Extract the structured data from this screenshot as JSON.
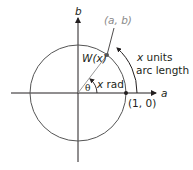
{
  "diagram": {
    "axes": {
      "horizontal_label": "a",
      "vertical_label": "b"
    },
    "point_label": "(a, b)",
    "function_label": "W(x)",
    "angle_symbol": "θ",
    "angle_label": "x rad",
    "arc_label_line1": "x units",
    "arc_label_line2": "arc length",
    "start_point_label": "(1, 0)",
    "colors": {
      "line": "#231f20",
      "point_label": "#8a8a8a",
      "radius": "#9a9a9a"
    }
  }
}
